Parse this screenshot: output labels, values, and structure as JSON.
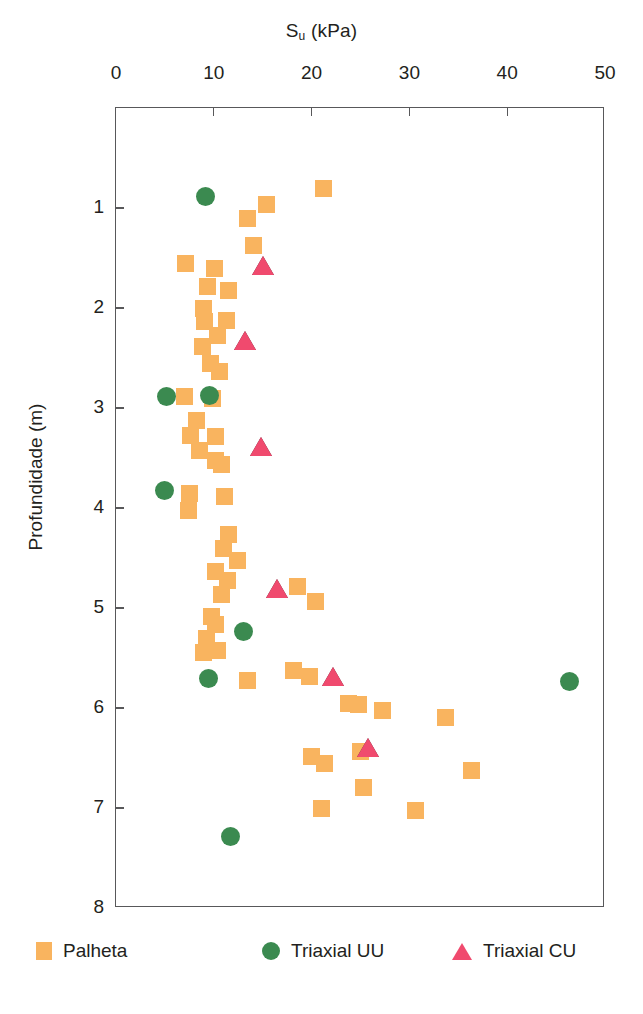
{
  "chart_data": {
    "type": "scatter",
    "title": "",
    "xlabel": "S_u (kPa)",
    "xlabel_base": "S",
    "xlabel_sub": "u",
    "xlabel_unit": " (kPa)",
    "ylabel": "Profundidade (m)",
    "xlim": [
      0,
      50
    ],
    "ylim": [
      0,
      8
    ],
    "y_inverted": true,
    "grid": false,
    "legend_position": "bottom",
    "xticks": [
      0,
      10,
      20,
      30,
      40,
      50
    ],
    "yticks": [
      1,
      2,
      3,
      4,
      5,
      6,
      7,
      8
    ],
    "xticklabels": [
      "0",
      "10",
      "20",
      "30",
      "40",
      "50"
    ],
    "yticklabels": [
      "1",
      "2",
      "3",
      "4",
      "5",
      "6",
      "7",
      "8"
    ],
    "series": [
      {
        "name": "Palheta",
        "marker": "square",
        "color": "#f9b45f",
        "points": [
          [
            21.2,
            0.8
          ],
          [
            15.4,
            0.96
          ],
          [
            13.4,
            1.1
          ],
          [
            14.1,
            1.37
          ],
          [
            7.1,
            1.55
          ],
          [
            10.1,
            1.6
          ],
          [
            9.4,
            1.78
          ],
          [
            11.5,
            1.82
          ],
          [
            8.9,
            2.0
          ],
          [
            9.0,
            2.13
          ],
          [
            11.3,
            2.12
          ],
          [
            10.4,
            2.27
          ],
          [
            8.8,
            2.38
          ],
          [
            9.7,
            2.55
          ],
          [
            10.6,
            2.63
          ],
          [
            7.0,
            2.88
          ],
          [
            9.9,
            2.9
          ],
          [
            8.2,
            3.12
          ],
          [
            7.6,
            3.27
          ],
          [
            10.2,
            3.28
          ],
          [
            8.5,
            3.42
          ],
          [
            10.2,
            3.52
          ],
          [
            10.8,
            3.56
          ],
          [
            7.5,
            3.85
          ],
          [
            11.1,
            3.88
          ],
          [
            7.4,
            4.02
          ],
          [
            11.5,
            4.26
          ],
          [
            11.0,
            4.4
          ],
          [
            12.4,
            4.52
          ],
          [
            10.2,
            4.63
          ],
          [
            11.4,
            4.72
          ],
          [
            10.8,
            4.86
          ],
          [
            18.6,
            4.78
          ],
          [
            20.4,
            4.93
          ],
          [
            9.8,
            5.08
          ],
          [
            10.2,
            5.16
          ],
          [
            9.3,
            5.3
          ],
          [
            8.9,
            5.44
          ],
          [
            10.4,
            5.42
          ],
          [
            18.1,
            5.62
          ],
          [
            19.8,
            5.68
          ],
          [
            13.4,
            5.72
          ],
          [
            23.8,
            5.95
          ],
          [
            24.8,
            5.96
          ],
          [
            27.3,
            6.02
          ],
          [
            33.7,
            6.09
          ],
          [
            20.0,
            6.48
          ],
          [
            21.3,
            6.55
          ],
          [
            25.0,
            6.43
          ],
          [
            25.3,
            6.79
          ],
          [
            36.3,
            6.62
          ],
          [
            21.0,
            7.0
          ],
          [
            30.6,
            7.02
          ]
        ]
      },
      {
        "name": "Triaxial UU",
        "marker": "circle",
        "color": "#3b8a50",
        "points": [
          [
            9.2,
            0.88
          ],
          [
            5.2,
            2.88
          ],
          [
            9.6,
            2.87
          ],
          [
            5.0,
            3.82
          ],
          [
            13.0,
            5.23
          ],
          [
            9.5,
            5.7
          ],
          [
            46.4,
            5.73
          ],
          [
            11.7,
            7.28
          ]
        ]
      },
      {
        "name": "Triaxial CU",
        "marker": "triangle",
        "color": "#f04a6e",
        "points": [
          [
            15.0,
            1.58
          ],
          [
            13.2,
            2.33
          ],
          [
            14.8,
            3.39
          ],
          [
            16.5,
            4.81
          ],
          [
            22.2,
            5.69
          ],
          [
            25.8,
            6.4
          ]
        ]
      }
    ]
  },
  "legend": [
    {
      "label": "Palheta",
      "marker": "square",
      "color": "#f9b45f"
    },
    {
      "label": "Triaxial UU",
      "marker": "circle",
      "color": "#3b8a50"
    },
    {
      "label": "Triaxial CU",
      "marker": "triangle",
      "color": "#f04a6e"
    }
  ]
}
